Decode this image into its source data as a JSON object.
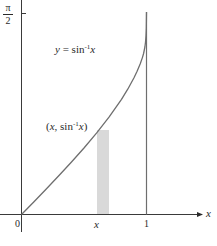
{
  "diagram": {
    "curve_label": {
      "lhs": "y",
      "eq": " = sin",
      "sup": "-1",
      "var": "x"
    },
    "point_label": {
      "open": "(",
      "x": "x",
      "mid": ", sin",
      "sup": "-1",
      "var": "x",
      "close": ")"
    },
    "y_tick": {
      "numerator": "π",
      "denominator": "2"
    },
    "x_ticks": {
      "origin": "0",
      "x": "x",
      "one": "1"
    },
    "x_axis_label": "x",
    "colors": {
      "axis": "#3a3a3a",
      "curve": "#6e6e6e",
      "strip": "#d9d9d9",
      "text": "#2a2a2a"
    }
  }
}
